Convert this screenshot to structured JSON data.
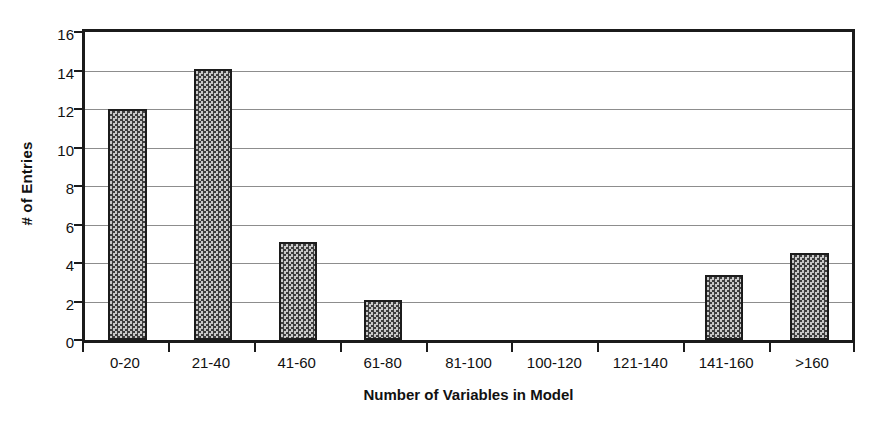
{
  "chart_data": {
    "type": "bar",
    "title": "",
    "xlabel": "Number of Variables in Model",
    "ylabel": "# of Entries",
    "categories": [
      "0-20",
      "21-40",
      "41-60",
      "61-80",
      "81-100",
      "100-120",
      "121-140",
      "141-160",
      ">160"
    ],
    "values": [
      12,
      14.1,
      5.1,
      2.1,
      0,
      0,
      0,
      3.4,
      4.5
    ],
    "ylim": [
      0,
      16
    ],
    "ytick_labels": [
      "16",
      "14",
      "12",
      "10",
      "8",
      "6",
      "4",
      "2",
      "0"
    ],
    "ytick_values": [
      16,
      14,
      12,
      10,
      8,
      6,
      4,
      2,
      0
    ],
    "grid": true,
    "legend": "none",
    "series_name": "# of Entries",
    "colors": {
      "bar_fill": "#5a5a5a",
      "bar_pattern_dark": "#3f3f3f",
      "bar_pattern_light": "#c9c9c9",
      "bar_border": "#1c1c1c",
      "axis": "#1b1b1b",
      "gridline": "#8d8d8d",
      "background": "#ffffff",
      "text": "#111111"
    }
  }
}
